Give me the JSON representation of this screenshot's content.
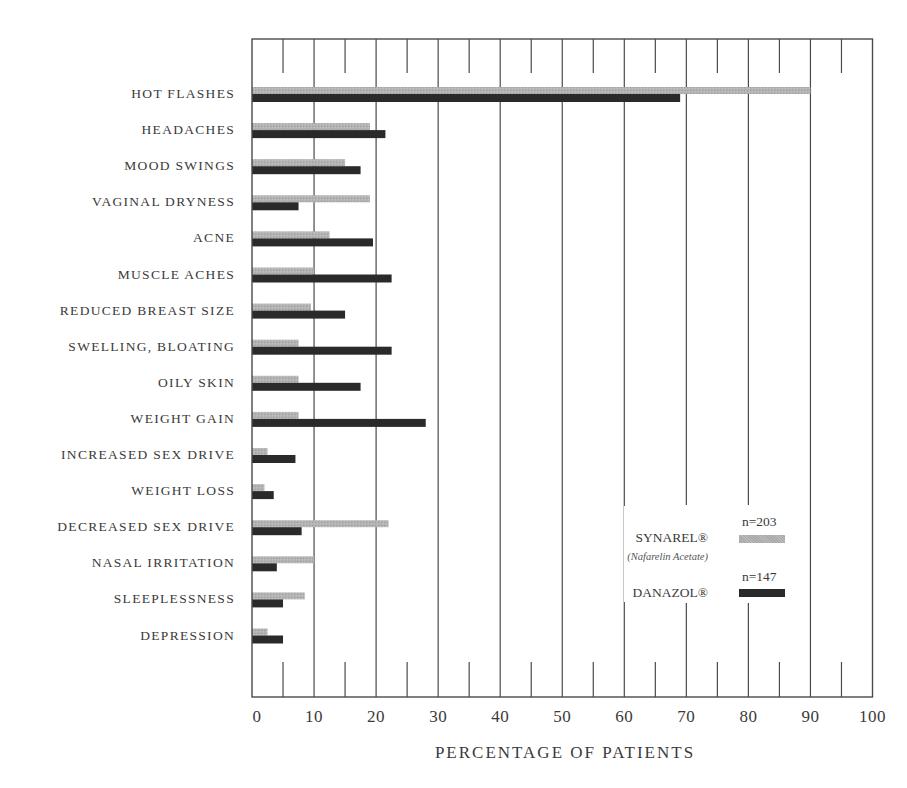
{
  "chart_data": {
    "type": "bar",
    "orientation": "horizontal",
    "title": "",
    "xlabel": "PERCENTAGE OF PATIENTS",
    "ylabel": "",
    "xlim": [
      0,
      100
    ],
    "x_ticks": [
      0,
      10,
      20,
      30,
      40,
      50,
      60,
      70,
      80,
      90,
      100
    ],
    "grid": true,
    "legend_position": "lower right inside",
    "categories": [
      "HOT FLASHES",
      "HEADACHES",
      "MOOD SWINGS",
      "VAGINAL DRYNESS",
      "ACNE",
      "MUSCLE ACHES",
      "REDUCED BREAST SIZE",
      "SWELLING, BLOATING",
      "OILY SKIN",
      "WEIGHT GAIN",
      "INCREASED SEX DRIVE",
      "WEIGHT LOSS",
      "DECREASED SEX DRIVE",
      "NASAL IRRITATION",
      "SLEEPLESSNESS",
      "DEPRESSION"
    ],
    "series": [
      {
        "name": "SYNAREL®",
        "subtitle": "(Nafarelin Acetate)",
        "n_label": "n=203",
        "color": "#b0b0b0",
        "values": [
          90,
          19,
          15,
          19,
          12.5,
          10,
          9.5,
          7.5,
          7.5,
          7.5,
          2.5,
          2,
          22,
          10,
          8.5,
          2.5
        ]
      },
      {
        "name": "DANAZOL®",
        "subtitle": "",
        "n_label": "n=147",
        "color": "#2a2a2a",
        "values": [
          69,
          21.5,
          17.5,
          7.5,
          19.5,
          22.5,
          15,
          22.5,
          17.5,
          28,
          7,
          3.5,
          8,
          4,
          5,
          5
        ]
      }
    ]
  },
  "legend": {
    "synarel": {
      "n": "n=203",
      "name": "SYNAREL®",
      "sub": "(Nafarelin Acetate)"
    },
    "danazol": {
      "n": "n=147",
      "name": "DANAZOL®"
    }
  },
  "axis": {
    "x_title": "PERCENTAGE OF PATIENTS",
    "tick_labels": [
      "0",
      "10",
      "20",
      "30",
      "40",
      "50",
      "60",
      "70",
      "80",
      "90",
      "100"
    ]
  },
  "colors": {
    "synarel": "#b0b0b0",
    "danazol": "#2a2a2a",
    "grid": "#4a4a4a"
  }
}
